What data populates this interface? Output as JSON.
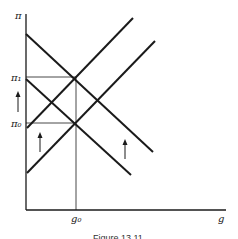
{
  "figure": {
    "caption": "Figure 13.11",
    "y_axis_label": "π",
    "x_axis_label": "g",
    "ticks": {
      "pi1": "π₁",
      "pi0": "π₀",
      "g0": "g₀"
    },
    "colors": {
      "line": "#1a1a1a",
      "background": "#ffffff"
    },
    "lines": [
      {
        "name": "downward-upper",
        "from": [
          26,
          34
        ],
        "to": [
          153,
          152
        ]
      },
      {
        "name": "downward-lower",
        "from": [
          26,
          79
        ],
        "to": [
          131,
          175
        ]
      },
      {
        "name": "upward-upper",
        "from": [
          27,
          128
        ],
        "to": [
          133,
          18
        ]
      },
      {
        "name": "upward-lower",
        "from": [
          27,
          173
        ],
        "to": [
          155,
          41
        ]
      }
    ],
    "arrows": [
      {
        "name": "left-axis-arrow",
        "direction": "up"
      },
      {
        "name": "inner-arrow",
        "direction": "up"
      },
      {
        "name": "right-arrow",
        "direction": "up"
      }
    ]
  }
}
